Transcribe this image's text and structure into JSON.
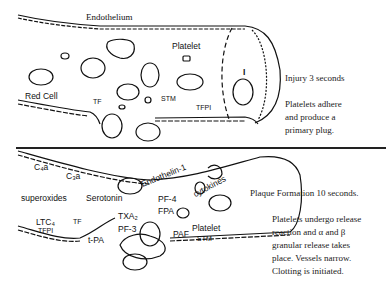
{
  "panel_top": {
    "labels": {
      "endothelium": "Endothelium",
      "platelet": "Platelet",
      "red_cell": "Red Cell",
      "tf": "TF",
      "stm": "STM",
      "tfpi": "TFPI",
      "roman_one": "I"
    },
    "caption_title": "Injury 3 seconds",
    "caption_body": [
      "Platelets adhere",
      "and produce a",
      "primary plug."
    ]
  },
  "panel_bottom": {
    "labels": {
      "c4a": "C₄a",
      "c3a": "C₃a",
      "endothelin": "Endothelin-1",
      "cytokines": "cytokines",
      "superoxides": "superoxides",
      "serotonin": "Serotonin",
      "pf4": "PF-4",
      "fpa": "FPA",
      "txa2": "TXA₂",
      "ltc4": "LTC₄",
      "tf": "TF",
      "tfpi": "TFPI",
      "pf3": "PF-3",
      "tpa": "t-PA",
      "paf": "PAF",
      "platelet": "Platelet",
      "stm": "STM"
    },
    "caption_title": "Plaque Formation 10 seconds.",
    "caption_body": [
      "Platelets undergo release",
      "reaction and α and β",
      "granular release takes",
      "place. Vessels narrow.",
      "Clotting is initiated."
    ]
  },
  "colors": {
    "ink": "#111111",
    "background": "#ffffff"
  }
}
